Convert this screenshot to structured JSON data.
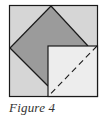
{
  "figure": {
    "caption": "Figure 4",
    "colors": {
      "outer_fill": "#d6d6d6",
      "diamond_fill": "#9b9b9b",
      "inner_fill": "#ededed",
      "stroke": "#1a1a1a"
    }
  }
}
